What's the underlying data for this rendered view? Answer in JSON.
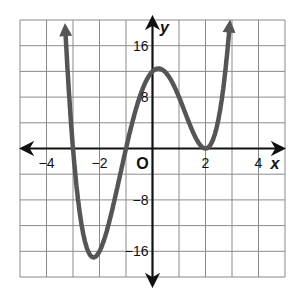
{
  "chart_data": {
    "type": "line",
    "title": "",
    "xlabel": "x",
    "ylabel": "y",
    "origin_label": "O",
    "xlim": [
      -5,
      5
    ],
    "ylim": [
      -20,
      20
    ],
    "x_grid_step": 1,
    "y_grid_step": 4,
    "grid": true,
    "x_ticks": [
      {
        "value": -4,
        "label": "−4"
      },
      {
        "value": -2,
        "label": "−2"
      },
      {
        "value": 2,
        "label": "2"
      },
      {
        "value": 4,
        "label": "4"
      }
    ],
    "y_ticks": [
      {
        "value": 16,
        "label": "16"
      },
      {
        "value": 8,
        "label": "8"
      },
      {
        "value": -8,
        "label": "−8"
      },
      {
        "value": -16,
        "label": "−16"
      }
    ],
    "series": [
      {
        "name": "f(x) = (x+3)(x+1)(x-2)^2",
        "domain": [
          -3.33,
          3.0
        ],
        "roots": [
          -3,
          -1,
          2
        ],
        "double_root": 2,
        "y_intercept": 12,
        "local_min": {
          "x": -2.2,
          "y": -16.9
        },
        "local_max": {
          "x": 0.3,
          "y": 12.4
        },
        "x": [
          -3.3,
          -3,
          -2.5,
          -2.2,
          -2,
          -1.5,
          -1,
          -0.5,
          0,
          0.3,
          0.5,
          1,
          1.5,
          2,
          2.5,
          2.9
        ],
        "values": [
          9.1,
          0,
          -16.9,
          -16.9,
          -16,
          -10.9,
          0,
          7.8,
          12,
          12.4,
          12.3,
          8,
          2.9,
          0,
          4.4,
          19.0
        ],
        "color": "#555555",
        "arrows_at_ends": true
      }
    ]
  }
}
